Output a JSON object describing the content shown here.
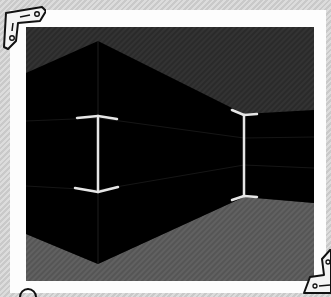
{
  "scene": {
    "type": "3d-corridor-view",
    "colors": {
      "background_stripe_a": "#c9c9c9",
      "background_stripe_b": "#dcdcdc",
      "frame": "#fdfdfd",
      "ceiling": "#2b2b2b",
      "walls": "#000000",
      "floor": "#5a5a5a",
      "edge_lines": "#1e1e1e",
      "corner_markers": "#e6e6e6"
    },
    "corner_markers": [
      {
        "name": "left-corner-marker",
        "x": 98,
        "top": 118,
        "bottom": 190
      },
      {
        "name": "right-corner-marker",
        "x": 244,
        "top": 115,
        "bottom": 197
      }
    ]
  },
  "decorations": {
    "corner_brackets": [
      "top-left",
      "bottom-right",
      "bottom-left-partial"
    ]
  }
}
